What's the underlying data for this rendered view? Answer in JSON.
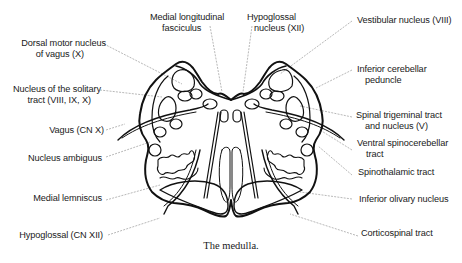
{
  "figure": {
    "title": "The medulla",
    "caption": "The medulla."
  },
  "labels": {
    "medial_longitudinal_fasciculus": [
      "Medial longitudinal",
      "fasciculus"
    ],
    "hypoglossal_nucleus": [
      "Hypoglossal",
      "nucleus (XII)"
    ],
    "vestibular_nucleus": [
      "Vestibular nucleus (VIII)"
    ],
    "dorsal_motor_nucleus": [
      "Dorsal motor nucleus",
      "of vagus (X)"
    ],
    "inferior_cerebellar_peduncle": [
      "Inferior cerebellar",
      "peduncle"
    ],
    "nucleus_solitary_tract": [
      "Nucleus of the solitary",
      "tract (VIII, IX, X)"
    ],
    "spinal_trigeminal": [
      "Spinal trigeminal tract",
      "and nucleus (V)"
    ],
    "vagus_nerve": [
      "Vagus (CN X)"
    ],
    "ventral_spinocerebellar": [
      "Ventral spinocerebellar",
      "tract"
    ],
    "nucleus_ambiguus": [
      "Nucleus ambiguus"
    ],
    "spinothalamic": [
      "Spinothalamic tract"
    ],
    "medial_lemniscus": [
      "Medial lemniscus"
    ],
    "inferior_olivary": [
      "Inferior olivary nucleus"
    ],
    "hypoglossal_nerve": [
      "Hypoglossal (CN XII)"
    ],
    "corticospinal": [
      "Corticospinal tract"
    ]
  },
  "colors": {
    "outline": "#111111",
    "leader": "#9a9a9a",
    "text": "#1a1a1a",
    "background": "#ffffff"
  }
}
